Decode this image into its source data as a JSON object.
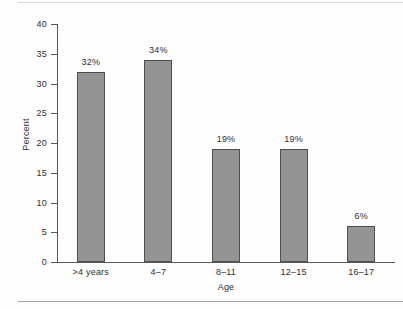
{
  "chart_data": {
    "type": "bar",
    "title": "",
    "subtitle": "",
    "xlabel": "Age",
    "ylabel": "Percent",
    "categories": [
      ">4 years",
      "4–7",
      "8–11",
      "12–15",
      "16–17"
    ],
    "values": [
      32,
      34,
      19,
      19,
      6
    ],
    "data_labels": [
      "32%",
      "34%",
      "19%",
      "19%",
      "6%"
    ],
    "ylim": [
      0,
      40
    ],
    "y_ticks": [
      0,
      5,
      10,
      15,
      20,
      25,
      30,
      35,
      40
    ],
    "y_tick_labels": [
      "0",
      "5",
      "10",
      "15",
      "20",
      "25",
      "30",
      "35",
      "40"
    ],
    "grid": false,
    "legend": false,
    "legend_position": "none",
    "bar_color": "#949494",
    "bar_edge_color": "#4e4e4e",
    "axis_color": "#585858",
    "background": "#fdfdfd",
    "text_color": "#303030"
  }
}
